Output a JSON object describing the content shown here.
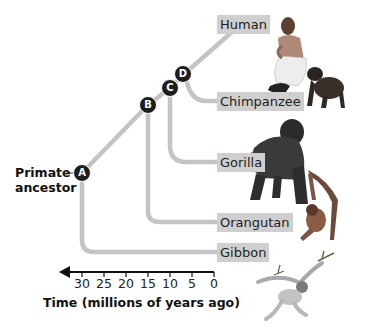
{
  "diagram": {
    "type": "phylogenetic-tree",
    "root_label": "Primate ancestor",
    "root_label_lines": [
      "Primate",
      "ancestor"
    ],
    "nodes": [
      {
        "id": "A",
        "label": "A",
        "time_mya": 30
      },
      {
        "id": "B",
        "label": "B",
        "time_mya": 15
      },
      {
        "id": "C",
        "label": "C",
        "time_mya": 10
      },
      {
        "id": "D",
        "label": "D",
        "time_mya": 6
      }
    ],
    "species": [
      {
        "name": "Human",
        "branches_from": "D"
      },
      {
        "name": "Chimpanzee",
        "branches_from": "D"
      },
      {
        "name": "Gorilla",
        "branches_from": "C"
      },
      {
        "name": "Orangutan",
        "branches_from": "B"
      },
      {
        "name": "Gibbon",
        "branches_from": "A"
      }
    ],
    "axis": {
      "title": "Time (millions of years ago)",
      "ticks": [
        "30",
        "25",
        "20",
        "15",
        "10",
        "5",
        "0"
      ]
    },
    "colors": {
      "branch": "#c4c4c4",
      "label_bg": "#cfcfcf",
      "node": "#1e1e1e",
      "axis": "#111111"
    }
  }
}
